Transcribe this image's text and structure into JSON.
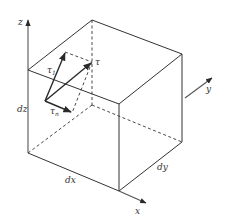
{
  "figure": {
    "type": "stress element cube with shear stress decomposition",
    "axes": {
      "x": "x",
      "y": "y",
      "z": "z"
    },
    "dimensions": {
      "dx": "dx",
      "dy": "dy",
      "dz": "dz"
    },
    "vectors": {
      "tau": "τ",
      "tau_1": {
        "base": "τ",
        "sub": "1"
      },
      "tau_n": {
        "base": "τ",
        "sub": "n"
      }
    },
    "colors": {
      "line": "#333333",
      "background": "#ffffff"
    }
  }
}
